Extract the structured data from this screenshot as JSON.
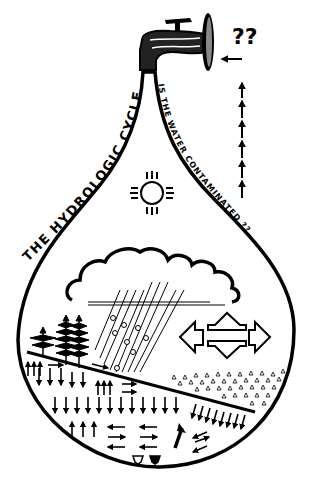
{
  "diagram": {
    "title": "THE HYDROLOGIC CYCLE",
    "question": "IS THE WATER CONTAMINATED ??",
    "faucet_question": "??",
    "colors": {
      "ink": "#000000",
      "background": "#ffffff"
    },
    "elements": [
      {
        "name": "faucet",
        "icon": "faucet-icon"
      },
      {
        "name": "water-drop-outline",
        "icon": "drop-outline"
      },
      {
        "name": "sun",
        "icon": "zia-sun-icon"
      },
      {
        "name": "cloud",
        "icon": "cloud-icon"
      },
      {
        "name": "rain",
        "icon": "rain-lines"
      },
      {
        "name": "evaporation-arrows",
        "icon": "four-direction-arrows-icon"
      },
      {
        "name": "trees",
        "icon": "tree-icon"
      },
      {
        "name": "ground-surface",
        "icon": "slope-line"
      },
      {
        "name": "aquifer-sediment",
        "icon": "triangle-pattern"
      },
      {
        "name": "groundwater-flow-arrows",
        "icon": "arrow-icon"
      },
      {
        "name": "upward-arrow-column",
        "icon": "dashed-up-arrows"
      }
    ]
  }
}
